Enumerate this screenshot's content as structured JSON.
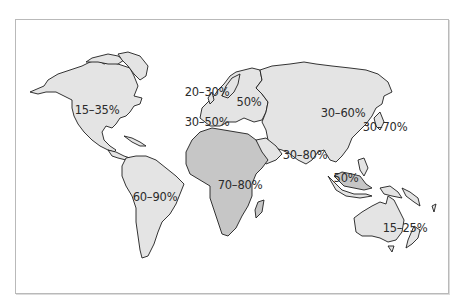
{
  "map": {
    "type": "world-choropleth",
    "colors": {
      "land_light": "#e4e4e4",
      "land_dark": "#c6c6c6",
      "outline": "#1e1e1e",
      "frame": "#b9b9b9",
      "background": "#ffffff",
      "label": "#2b2b2b"
    },
    "regions": [
      {
        "name": "North America",
        "label": "15–35%",
        "x": 97,
        "y": 110
      },
      {
        "name": "Northern Europe",
        "label": "20–30%",
        "x": 207,
        "y": 92
      },
      {
        "name": "Eastern Europe",
        "label": "50%",
        "x": 249,
        "y": 102
      },
      {
        "name": "Southern Europe",
        "label": "30–50%",
        "x": 207,
        "y": 122
      },
      {
        "name": "Russia / North Asia",
        "label": "30–60%",
        "x": 343,
        "y": 113
      },
      {
        "name": "East Asia / Japan",
        "label": "30–70%",
        "x": 385,
        "y": 127
      },
      {
        "name": "South Asia",
        "label": "30–80%",
        "x": 305,
        "y": 155
      },
      {
        "name": "Southeast Asia",
        "label": "50%",
        "x": 346,
        "y": 178
      },
      {
        "name": "Africa",
        "label": "70–80%",
        "x": 240,
        "y": 185
      },
      {
        "name": "South America",
        "label": "60–90%",
        "x": 155,
        "y": 197
      },
      {
        "name": "Australia",
        "label": "15–25%",
        "x": 405,
        "y": 228
      }
    ]
  }
}
